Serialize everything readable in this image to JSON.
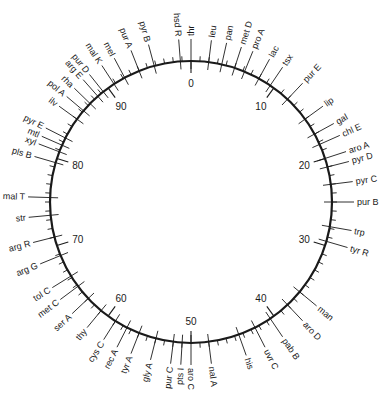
{
  "diagram": {
    "type": "circular-genetic-map",
    "center": [
      191,
      202
    ],
    "radius": 141,
    "total_minutes": 100,
    "colors": {
      "line": "#1a1a1a",
      "background": "#ffffff"
    },
    "minute_labels": [
      {
        "minute": 0,
        "label": "0"
      },
      {
        "minute": 10,
        "label": "10"
      },
      {
        "minute": 20,
        "label": "20"
      },
      {
        "minute": 30,
        "label": "30"
      },
      {
        "minute": 40,
        "label": "40"
      },
      {
        "minute": 50,
        "label": "50"
      },
      {
        "minute": 60,
        "label": "60"
      },
      {
        "minute": 70,
        "label": "70"
      },
      {
        "minute": 80,
        "label": "80"
      },
      {
        "minute": 90,
        "label": "90"
      }
    ],
    "genes": [
      {
        "name": "thr",
        "minute": 0
      },
      {
        "name": "leu",
        "minute": 2
      },
      {
        "name": "pan",
        "minute": 3.5
      },
      {
        "name": "met D",
        "minute": 5
      },
      {
        "name": "pro A",
        "minute": 6.2
      },
      {
        "name": "lac",
        "minute": 8
      },
      {
        "name": "tsx",
        "minute": 9.5
      },
      {
        "name": "pur E",
        "minute": 12
      },
      {
        "name": "lip",
        "minute": 15
      },
      {
        "name": "gal",
        "minute": 17
      },
      {
        "name": "chl E",
        "minute": 18.3
      },
      {
        "name": "aro A",
        "minute": 20
      },
      {
        "name": "pyr D",
        "minute": 21
      },
      {
        "name": "pyr C",
        "minute": 23
      },
      {
        "name": "pur B",
        "minute": 25
      },
      {
        "name": "trp",
        "minute": 27.8
      },
      {
        "name": "tyr R",
        "minute": 29.5
      },
      {
        "name": "man",
        "minute": 36
      },
      {
        "name": "aro D",
        "minute": 38
      },
      {
        "name": "pab B",
        "minute": 40.5
      },
      {
        "name": "uvr C",
        "minute": 42.5
      },
      {
        "name": "his",
        "minute": 44.5
      },
      {
        "name": "nal A",
        "minute": 48
      },
      {
        "name": "aro C",
        "minute": 50
      },
      {
        "name": "pts I",
        "minute": 51
      },
      {
        "name": "pur C",
        "minute": 52
      },
      {
        "name": "gly A",
        "minute": 54
      },
      {
        "name": "tyr A",
        "minute": 56
      },
      {
        "name": "rec A",
        "minute": 57.5
      },
      {
        "name": "cys C",
        "minute": 59
      },
      {
        "name": "thy",
        "minute": 61
      },
      {
        "name": "ser A",
        "minute": 63
      },
      {
        "name": "met C",
        "minute": 64.8
      },
      {
        "name": "tol C",
        "minute": 66.2
      },
      {
        "name": "arg G",
        "minute": 68.8
      },
      {
        "name": "arg R",
        "minute": 71
      },
      {
        "name": "str",
        "minute": 73.5
      },
      {
        "name": "mal T",
        "minute": 75.5
      },
      {
        "name": "pls B",
        "minute": 79.5
      },
      {
        "name": "xyl",
        "minute": 80.8
      },
      {
        "name": "mtl",
        "minute": 81.6
      },
      {
        "name": "pyr E",
        "minute": 82.5
      },
      {
        "name": "ilv",
        "minute": 85
      },
      {
        "name": "pol A",
        "minute": 86.2
      },
      {
        "name": "rha",
        "minute": 87.3
      },
      {
        "name": "arg E",
        "minute": 88.5
      },
      {
        "name": "pur D",
        "minute": 89.3
      },
      {
        "name": "mal K",
        "minute": 90.8
      },
      {
        "name": "mel",
        "minute": 92.2
      },
      {
        "name": "pur A",
        "minute": 94
      },
      {
        "name": "pyr B",
        "minute": 95.8
      },
      {
        "name": "hsd R",
        "minute": 98.8
      }
    ]
  }
}
